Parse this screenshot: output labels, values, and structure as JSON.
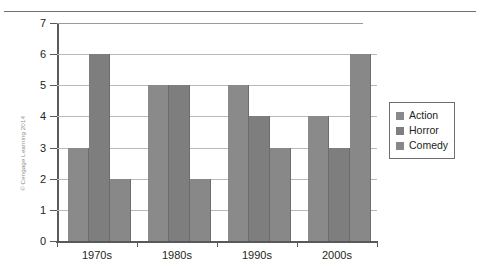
{
  "figure": {
    "copyright": "© Cengage Learning 2014"
  },
  "legend": {
    "position": "right",
    "entries": [
      {
        "label": "Action",
        "color": "#8a8a8a"
      },
      {
        "label": "Horror",
        "color": "#7e7e7e"
      },
      {
        "label": "Comedy",
        "color": "#888888"
      }
    ]
  },
  "axis": {
    "y_ticks": [
      "0",
      "1",
      "2",
      "3",
      "4",
      "5",
      "6",
      "7"
    ],
    "x_ticks": [
      "1970s",
      "1980s",
      "1990s",
      "2000s"
    ]
  },
  "chart_data": {
    "type": "bar",
    "title": "",
    "xlabel": "",
    "ylabel": "",
    "ylim": [
      0,
      7
    ],
    "ytick_step": 1,
    "grid": true,
    "legend_position": "right",
    "categories": [
      "1970s",
      "1980s",
      "1990s",
      "2000s"
    ],
    "series": [
      {
        "name": "Action",
        "values": [
          3,
          5,
          5,
          4
        ]
      },
      {
        "name": "Horror",
        "values": [
          6,
          5,
          4,
          3
        ]
      },
      {
        "name": "Comedy",
        "values": [
          2,
          2,
          3,
          6
        ]
      }
    ]
  }
}
